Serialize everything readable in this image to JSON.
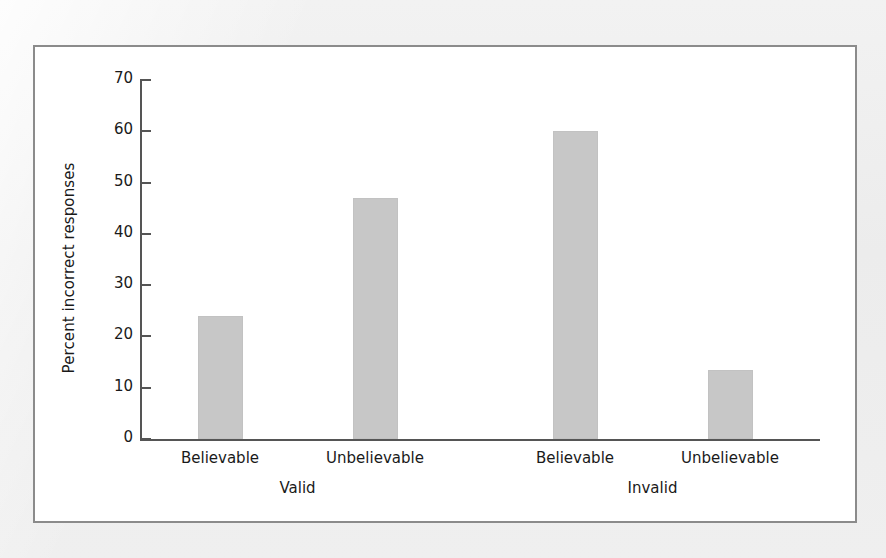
{
  "figure": {
    "frame_border_color": "#8b8b8b",
    "page_background": "#eeeeee",
    "plot_background": "#ffffff"
  },
  "chart_data": {
    "type": "bar",
    "title": "",
    "xlabel": "",
    "ylabel": "Percent incorrect responses",
    "ylim": [
      0,
      70
    ],
    "yticks": [
      0,
      10,
      20,
      30,
      40,
      50,
      60,
      70
    ],
    "ytick_labels": [
      "0",
      "10",
      "20",
      "30",
      "40",
      "50",
      "60",
      "70"
    ],
    "grid": false,
    "legend": "none",
    "bar_color": "#c7c7c7",
    "categories": [
      "Believable",
      "Unbelievable",
      "Believable",
      "Unbelievable"
    ],
    "values": [
      24,
      47,
      60,
      13.5
    ],
    "groups": [
      {
        "label": "Valid",
        "categories": [
          "Believable",
          "Unbelievable"
        ],
        "values": [
          24,
          47
        ]
      },
      {
        "label": "Invalid",
        "categories": [
          "Believable",
          "Unbelievable"
        ],
        "values": [
          60,
          13.5
        ]
      }
    ],
    "bars": [
      {
        "category": "Believable",
        "group": "Valid",
        "value": 24
      },
      {
        "category": "Unbelievable",
        "group": "Valid",
        "value": 47
      },
      {
        "category": "Believable",
        "group": "Invalid",
        "value": 60
      },
      {
        "category": "Unbelievable",
        "group": "Invalid",
        "value": 13.5
      }
    ]
  }
}
